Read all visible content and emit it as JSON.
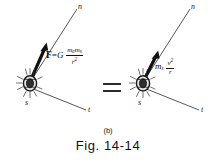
{
  "figure": {
    "caption_part": "(b)",
    "caption_number": "Fig. 14-14",
    "background_color": "#ffffff",
    "ink_color": "#111111"
  },
  "left_diagram": {
    "name": "gravitational-force-diagram",
    "body_label": "s",
    "body_icon": "sun-icon",
    "axis_normal_label": "n",
    "axis_tangent_label": "t",
    "force_arrow_name": "force-vector-arrow",
    "equation": {
      "force_symbol": "F",
      "equals": "=",
      "constant": "G",
      "numerator_m1": "m",
      "numerator_m1_sub": "e",
      "numerator_m2": "m",
      "numerator_m2_sub": "s",
      "denominator": "r",
      "denominator_exp": "2"
    }
  },
  "relation": {
    "equals_sign": "=",
    "name": "equals-sign"
  },
  "right_diagram": {
    "name": "centripetal-force-diagram",
    "body_label": "s",
    "body_icon": "sun-icon",
    "axis_normal_label": "n",
    "axis_tangent_label": "t",
    "force_arrow_name": "centripetal-vector-arrow",
    "equation": {
      "mass": "m",
      "mass_sub": "s",
      "numerator": "v",
      "numerator_exp": "2",
      "denominator": "r"
    }
  }
}
